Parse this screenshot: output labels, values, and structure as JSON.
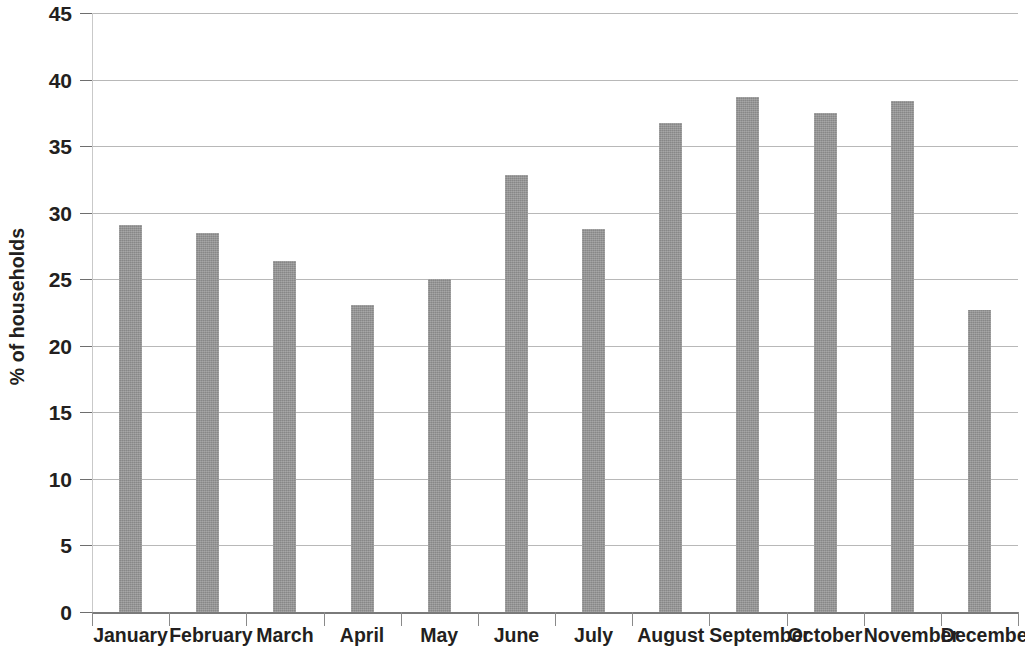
{
  "chart_data": {
    "type": "bar",
    "title": "",
    "subtitle": "",
    "xlabel": "",
    "ylabel": "% of households",
    "ylim": [
      0,
      45
    ],
    "ytick_step": 5,
    "yticks": [
      0,
      5,
      10,
      15,
      20,
      25,
      30,
      35,
      40,
      45
    ],
    "ytick_labels": [
      "0",
      "5",
      "10",
      "15",
      "20",
      "25",
      "30",
      "35",
      "40",
      "45"
    ],
    "grid": true,
    "grid_axis": "y",
    "legend": false,
    "legend_position": "none",
    "categories": [
      "January",
      "February",
      "March",
      "April",
      "May",
      "June",
      "July",
      "August",
      "September",
      "October",
      "November",
      "December"
    ],
    "values": [
      29.1,
      28.5,
      26.4,
      23.1,
      25.0,
      32.8,
      28.8,
      36.7,
      38.7,
      37.5,
      38.4,
      22.7
    ],
    "series": [
      {
        "name": "% of households",
        "values": [
          29.1,
          28.5,
          26.4,
          23.1,
          25.0,
          32.8,
          28.8,
          36.7,
          38.7,
          37.5,
          38.4,
          22.7
        ]
      }
    ],
    "colors": {
      "bar": "#949494",
      "gridline": "#b8b8b8",
      "axis": "#7a7a7a",
      "text": "#231f20",
      "background": "#ffffff"
    }
  }
}
